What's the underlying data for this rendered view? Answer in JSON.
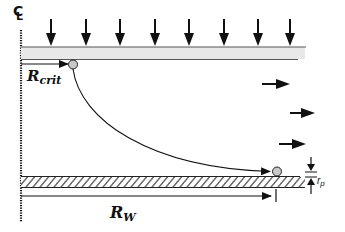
{
  "diagram": {
    "centerline_symbol": "C",
    "centerline_subscript": "L",
    "labels": {
      "r_crit": {
        "main": "R",
        "sub": "crit"
      },
      "r_w": {
        "main": "R",
        "sub": "W"
      },
      "r_p": {
        "main": "r",
        "sub": "p"
      }
    },
    "elements": {
      "top_plate": "gray top boundary plate",
      "bottom_plate": "hatched bottom wall",
      "downward_arrows_count": 8,
      "rightward_arrows_count": 3,
      "particles": [
        "particle at R_crit on top plate",
        "particle deposited on bottom wall"
      ],
      "trajectory": "curved path from top particle to bottom particle"
    },
    "colors": {
      "line": "#111111",
      "plate_fill": "#e6e6e6",
      "particle_fill": "#c8c8c8",
      "background": "#ffffff"
    }
  }
}
